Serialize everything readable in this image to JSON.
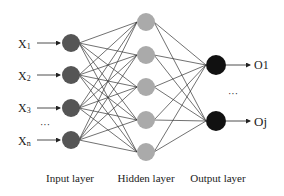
{
  "diagram": {
    "colors": {
      "input_node": "#555555",
      "hidden_node": "#aaaaaa",
      "output_node": "#111111",
      "edge": "#333333"
    },
    "input_layer": {
      "label": "Input layer",
      "inputs": [
        {
          "name": "X",
          "sub": "1"
        },
        {
          "name": "X",
          "sub": "2"
        },
        {
          "name": "X",
          "sub": "3"
        },
        {
          "name": "X",
          "sub": "n"
        }
      ],
      "ellipsis": "···"
    },
    "hidden_layer": {
      "label": "Hidden layer",
      "node_count": 5
    },
    "output_layer": {
      "label": "Output layer",
      "outputs": [
        {
          "name": "O1"
        },
        {
          "name": "Oj"
        }
      ],
      "ellipsis": "···"
    }
  }
}
